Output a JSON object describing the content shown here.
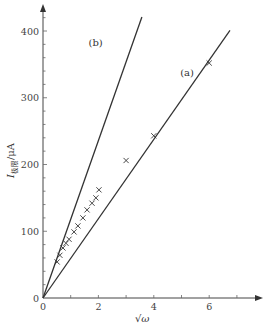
{
  "chart_data": {
    "type": "scatter",
    "title": "",
    "xlabel": "√ω",
    "ylabel": "I极限/μA",
    "ylabel_main": "I",
    "ylabel_sub": "极限",
    "ylabel_unit": "/μA",
    "xlim": [
      0,
      7.5
    ],
    "ylim": [
      0,
      440
    ],
    "x_ticks": [
      0,
      2,
      4,
      6
    ],
    "x_tick_labels": [
      "0",
      "2",
      "4",
      "6"
    ],
    "x_minor_ticks": [
      1,
      3,
      5,
      7
    ],
    "y_ticks": [
      0,
      100,
      200,
      300,
      400
    ],
    "y_tick_labels": [
      "0",
      "100",
      "200",
      "300",
      "400"
    ],
    "y_minor_step": 20,
    "grid": false,
    "legend": "none",
    "lines": [
      {
        "name": "(a)",
        "label": "(a)",
        "x": [
          0,
          6.75
        ],
        "y": [
          0,
          401
        ],
        "slope": 59.5
      },
      {
        "name": "(b)",
        "label": "(b)",
        "x": [
          0,
          3.57
        ],
        "y": [
          0,
          421
        ],
        "slope": 118
      }
    ],
    "series": [
      {
        "name": "measured",
        "marker": "x",
        "x": [
          0.51,
          0.61,
          0.72,
          0.83,
          0.94,
          1.12,
          1.26,
          1.44,
          1.59,
          1.77,
          1.91,
          2.02,
          3.0,
          4.0,
          6.0
        ],
        "y": [
          54,
          64,
          75,
          82,
          88,
          99,
          108,
          120,
          132,
          142,
          150,
          162,
          206,
          243,
          352
        ]
      }
    ],
    "annotations": [
      {
        "text": "(a)",
        "x": 5.2,
        "y": 333
      },
      {
        "text": "(b)",
        "x": 1.9,
        "y": 378
      }
    ]
  }
}
